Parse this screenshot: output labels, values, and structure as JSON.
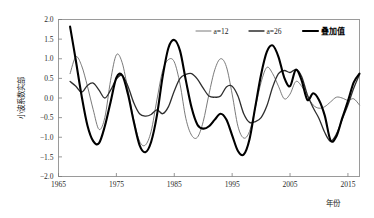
{
  "chart_data": {
    "type": "line",
    "title": "",
    "xlabel": "年份",
    "ylabel": "小波系数实部",
    "xlim": [
      1965,
      2017
    ],
    "ylim": [
      -2.0,
      2.0
    ],
    "grid": false,
    "legend_position": "top-right",
    "xticks": [
      1965,
      1975,
      1985,
      1995,
      2005,
      2015
    ],
    "xtick_labels": [
      "1965",
      "1975",
      "1985",
      "1995",
      "2005",
      "2015"
    ],
    "yticks": [
      -2.0,
      -1.5,
      -1.0,
      -0.5,
      0.0,
      0.5,
      1.0,
      1.5,
      2.0
    ],
    "ytick_labels": [
      "-2.0",
      "-1.5",
      "-1.0",
      "-0.5",
      "0.0",
      "0.5",
      "1.0",
      "1.5",
      "2.0"
    ],
    "x": [
      1967,
      1968,
      1969,
      1970,
      1971,
      1972,
      1973,
      1974,
      1975,
      1976,
      1977,
      1978,
      1979,
      1980,
      1981,
      1982,
      1983,
      1984,
      1985,
      1986,
      1987,
      1988,
      1989,
      1990,
      1991,
      1992,
      1993,
      1994,
      1995,
      1996,
      1997,
      1998,
      1999,
      2000,
      2001,
      2002,
      2003,
      2004,
      2005,
      2006,
      2007,
      2008,
      2009,
      2010,
      2011,
      2012,
      2013,
      2014,
      2015,
      2016,
      2017
    ],
    "series": [
      {
        "name": "a=12",
        "style": "thin-gray",
        "color": "#6b6b6b",
        "width": 0.9,
        "values": [
          0.62,
          1.05,
          0.82,
          0.3,
          -0.3,
          -0.8,
          -0.5,
          0.45,
          1.1,
          0.9,
          0.2,
          -0.55,
          -1.1,
          -1.2,
          -0.85,
          -0.05,
          0.7,
          0.98,
          0.92,
          0.35,
          -0.52,
          -0.95,
          -1.0,
          -0.6,
          0.1,
          0.72,
          1.0,
          0.8,
          0.1,
          -0.72,
          -1.02,
          -0.85,
          -0.25,
          0.4,
          0.78,
          0.62,
          0.3,
          -0.02,
          0.1,
          0.42,
          0.3,
          0.05,
          -0.18,
          -0.26,
          -0.22,
          -0.1,
          0.02,
          0.0,
          -0.06,
          -0.02,
          -0.18
        ]
      },
      {
        "name": "a=26",
        "style": "medium-dark",
        "color": "#2e2e2e",
        "width": 1.3,
        "values": [
          0.42,
          0.3,
          0.15,
          0.32,
          0.38,
          0.2,
          0.0,
          0.2,
          0.48,
          0.58,
          0.3,
          -0.12,
          -0.4,
          -0.46,
          -0.42,
          -0.3,
          -0.4,
          -0.22,
          0.18,
          0.5,
          0.6,
          0.62,
          0.48,
          0.25,
          0.05,
          0.02,
          0.05,
          0.28,
          0.3,
          0.05,
          -0.4,
          -0.62,
          -0.6,
          -0.5,
          -0.2,
          0.28,
          0.62,
          0.7,
          0.65,
          0.72,
          0.55,
          0.08,
          -0.25,
          -0.52,
          -0.88,
          -1.1,
          -0.92,
          -0.55,
          -0.18,
          0.25,
          0.6
        ]
      },
      {
        "name": "叠加值",
        "style": "thick-black",
        "color": "#000000",
        "width": 2.1,
        "values": [
          1.82,
          0.95,
          0.05,
          -0.7,
          -1.1,
          -1.15,
          -0.72,
          -0.1,
          0.52,
          0.58,
          0.1,
          -0.6,
          -1.2,
          -1.38,
          -1.12,
          -0.45,
          0.55,
          1.28,
          1.48,
          1.2,
          0.45,
          -0.25,
          -0.68,
          -0.78,
          -0.72,
          -0.55,
          -0.4,
          -0.55,
          -0.95,
          -1.35,
          -1.44,
          -1.05,
          -0.22,
          0.6,
          1.18,
          1.34,
          1.05,
          0.52,
          0.3,
          0.72,
          0.45,
          -0.05,
          0.12,
          -0.05,
          -0.45,
          -1.08,
          -0.98,
          -0.52,
          -0.08,
          0.4,
          0.62
        ]
      }
    ]
  },
  "legend": {
    "items": [
      {
        "label": "a=12"
      },
      {
        "label": "a=26"
      },
      {
        "label": "叠加值"
      }
    ]
  },
  "axes": {
    "x_title": "年份",
    "y_title": "小波系数实部"
  }
}
